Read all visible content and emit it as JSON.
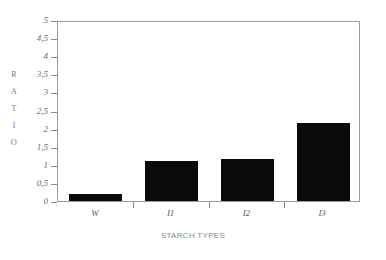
{
  "chart_data": {
    "type": "bar",
    "title": "",
    "subtitle": "",
    "xlabel": "STARCH TYPES",
    "ylabel": "RATIO",
    "categories": [
      "W",
      "I1",
      "I2",
      "I3"
    ],
    "values": [
      0.2,
      1.1,
      1.15,
      2.15
    ],
    "ylim": [
      0,
      5
    ],
    "ytick_labels": [
      "0",
      "0,5",
      "1",
      "1,5",
      "2",
      "2,5",
      "3",
      "3,5",
      "4",
      "4,5",
      "5"
    ],
    "ytick_values": [
      0,
      0.5,
      1,
      1.5,
      2,
      2.5,
      3,
      3.5,
      4,
      4.5,
      5
    ],
    "decimal_separator": ",",
    "grid": false,
    "legend": null,
    "bar_color": "#0a0a0a",
    "frame_color": "#9a9a9a",
    "background": "#ffffff",
    "ylabel_letters": [
      "R",
      "A",
      "T",
      "I",
      "O"
    ],
    "series": [
      {
        "name": "Ratio",
        "values": [
          0.2,
          1.1,
          1.15,
          2.15
        ]
      }
    ]
  }
}
